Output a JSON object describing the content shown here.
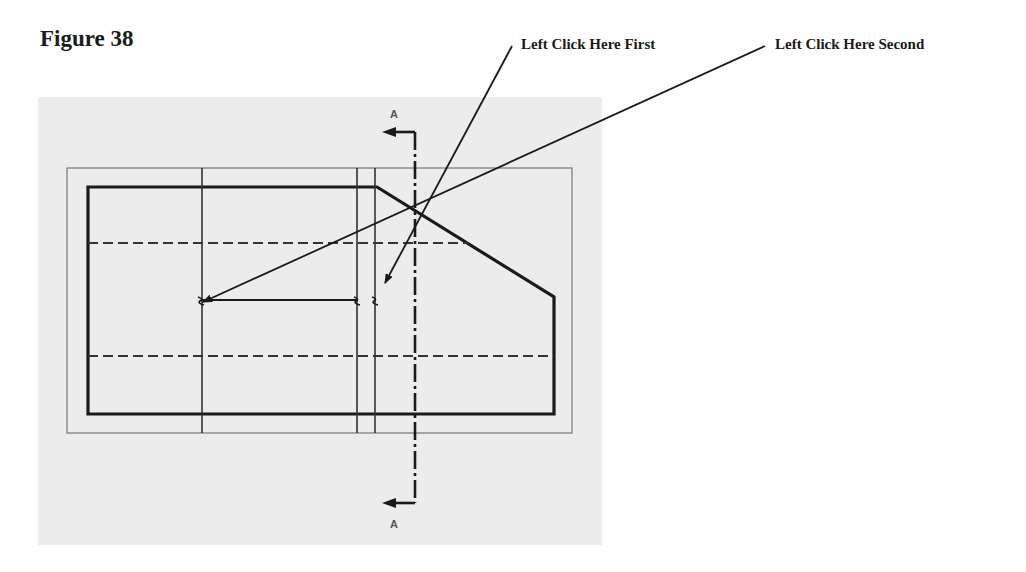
{
  "figure": {
    "title": "Figure 38"
  },
  "callouts": [
    {
      "label": "Left Click Here First",
      "target": "right vertical line near section line"
    },
    {
      "label": "Left Click Here Second",
      "target": "left end of horizontal dimension line"
    }
  ],
  "drawing": {
    "section_label_top": "A",
    "section_label_bottom": "A",
    "colors": {
      "panel_background": "#ececec",
      "outline": "#1a1a1a",
      "thin_line": "#444444",
      "frame": "#666666"
    }
  }
}
